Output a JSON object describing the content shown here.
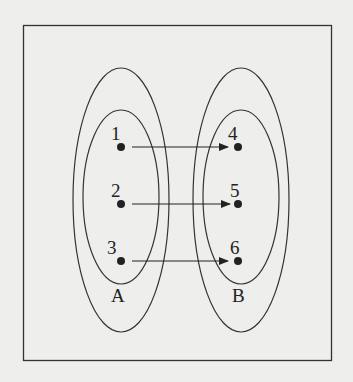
{
  "diagram": {
    "type": "mapping-diagram",
    "sets": [
      {
        "name": "A",
        "elements": [
          "1",
          "2",
          "3"
        ]
      },
      {
        "name": "B",
        "elements": [
          "4",
          "5",
          "6"
        ]
      }
    ],
    "mappings": [
      {
        "from": "1",
        "to": "4"
      },
      {
        "from": "2",
        "to": "5"
      },
      {
        "from": "3",
        "to": "6"
      }
    ],
    "labels": {
      "set_a": "A",
      "set_b": "B",
      "a1": "1",
      "a2": "2",
      "a3": "3",
      "b1": "4",
      "b2": "5",
      "b3": "6"
    }
  }
}
